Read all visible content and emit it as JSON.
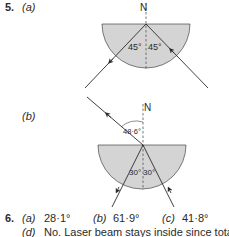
{
  "q5": {
    "number": "5.",
    "part_a": {
      "label": "(a)",
      "normal_label": "N",
      "angle_left": "45°",
      "angle_right": "45°"
    },
    "part_b": {
      "label": "(b)",
      "normal_label": "N",
      "incident_angle": "48·6°",
      "angle_left": "30°",
      "angle_right": "30°"
    }
  },
  "q6": {
    "number": "6.",
    "answers": [
      {
        "label": "(a)",
        "value": "28·1°"
      },
      {
        "label": "(b)",
        "value": "61·9°"
      },
      {
        "label": "(c)",
        "value": "41·8°"
      }
    ],
    "part_d": {
      "label": "(d)",
      "text": "No. Laser beam stays inside since total"
    }
  },
  "colors": {
    "glass_fill": "#d4d4d4",
    "line": "#2a2a2a"
  }
}
